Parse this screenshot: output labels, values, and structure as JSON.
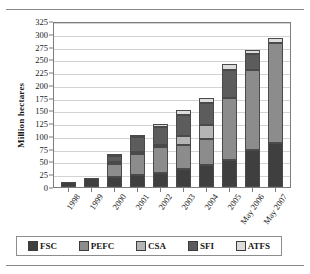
{
  "chart_data": {
    "type": "bar",
    "stacked": true,
    "title": "",
    "xlabel": "",
    "ylabel": "Million hectares",
    "ylim": [
      0,
      325
    ],
    "ytick_step": 25,
    "yticks": [
      0,
      25,
      50,
      75,
      100,
      125,
      150,
      175,
      200,
      225,
      250,
      275,
      300,
      325
    ],
    "grid": true,
    "legend_position": "bottom",
    "categories": [
      "1998",
      "1999",
      "2000",
      "2001",
      "2002",
      "2003",
      "2004",
      "2005",
      "May 2006",
      "May 2007"
    ],
    "series": [
      {
        "name": "FSC",
        "color": "#3f3f3f",
        "values": [
          10,
          17,
          19,
          24,
          28,
          35,
          43,
          52,
          72,
          86
        ]
      },
      {
        "name": "PEFC",
        "color": "#8c8c8c",
        "values": [
          0,
          0,
          26,
          41,
          50,
          48,
          52,
          123,
          157,
          196
        ]
      },
      {
        "name": "CSA",
        "color": "#b5b5b5",
        "values": [
          0,
          0,
          2,
          2,
          3,
          17,
          27,
          0,
          0,
          0
        ]
      },
      {
        "name": "SFI",
        "color": "#5c5c5c",
        "values": [
          0,
          0,
          11,
          30,
          36,
          41,
          43,
          55,
          32,
          0
        ]
      },
      {
        "name": "ATFS",
        "color": "#dcdcdc",
        "values": [
          0,
          0,
          4,
          3,
          6,
          9,
          10,
          10,
          7,
          10
        ]
      }
    ],
    "totals": [
      10,
      17,
      62,
      100,
      123,
      150,
      175,
      240,
      268,
      292
    ]
  },
  "legend": {
    "entries": [
      {
        "label": "FSC"
      },
      {
        "label": "PEFC"
      },
      {
        "label": "CSA"
      },
      {
        "label": "SFI"
      },
      {
        "label": "ATFS"
      }
    ]
  }
}
